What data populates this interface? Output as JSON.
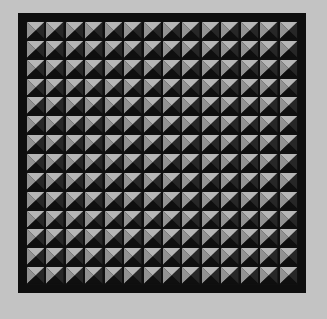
{
  "pattern": {
    "name": "pyramid-stud-grid",
    "rows": 14,
    "columns": 14,
    "colors": {
      "background": "#c3c3c3",
      "frame": "#0e0e0e",
      "face_top": "#b2b2b2",
      "face_left": "#8c8c8c",
      "face_right": "#353535",
      "face_bottom": "#151515"
    }
  }
}
